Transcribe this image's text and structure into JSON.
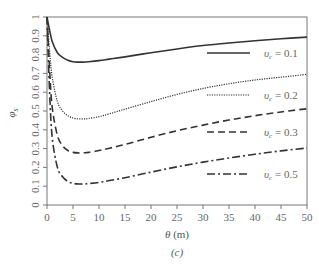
{
  "chart_data": {
    "type": "line",
    "title": "",
    "caption": "(c)",
    "xlabel": "θ (m)",
    "ylabel": "φ_s",
    "xlim": [
      0,
      50
    ],
    "ylim": [
      0,
      1
    ],
    "xticks": [
      0,
      5,
      10,
      15,
      20,
      25,
      30,
      35,
      40,
      45,
      50
    ],
    "yticks": [
      0,
      0.1,
      0.2,
      0.3,
      0.4,
      0.5,
      0.6,
      0.7,
      0.8,
      0.9,
      1
    ],
    "grid": false,
    "legend_position": "inside-right",
    "x": [
      0,
      0.5,
      1,
      2,
      3,
      4,
      5,
      6,
      7,
      8,
      10,
      12,
      15,
      20,
      25,
      30,
      35,
      40,
      45,
      50
    ],
    "series": [
      {
        "name": "υc = 0.1",
        "style": "solid",
        "values": [
          1.0,
          0.93,
          0.87,
          0.81,
          0.785,
          0.77,
          0.762,
          0.76,
          0.76,
          0.762,
          0.768,
          0.776,
          0.788,
          0.81,
          0.83,
          0.848,
          0.862,
          0.874,
          0.884,
          0.893
        ]
      },
      {
        "name": "υc = 0.2",
        "style": "dotted",
        "values": [
          1.0,
          0.82,
          0.68,
          0.55,
          0.5,
          0.475,
          0.463,
          0.458,
          0.458,
          0.46,
          0.47,
          0.485,
          0.51,
          0.55,
          0.588,
          0.62,
          0.645,
          0.665,
          0.68,
          0.695
        ]
      },
      {
        "name": "υc = 0.3",
        "style": "dashed",
        "values": [
          1.0,
          0.72,
          0.52,
          0.37,
          0.315,
          0.29,
          0.28,
          0.277,
          0.278,
          0.28,
          0.29,
          0.302,
          0.322,
          0.36,
          0.395,
          0.425,
          0.452,
          0.475,
          0.495,
          0.512
        ]
      },
      {
        "name": "υc = 0.5",
        "style": "dash-dot",
        "values": [
          1.0,
          0.6,
          0.36,
          0.2,
          0.15,
          0.125,
          0.115,
          0.112,
          0.112,
          0.114,
          0.12,
          0.13,
          0.145,
          0.175,
          0.203,
          0.228,
          0.25,
          0.27,
          0.288,
          0.303
        ]
      }
    ]
  }
}
